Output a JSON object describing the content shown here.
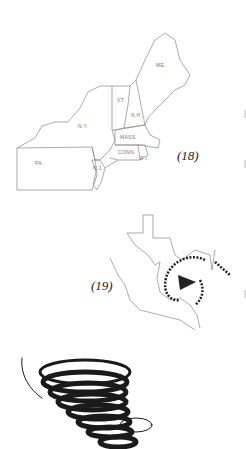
{
  "figures": [
    {
      "id": "18",
      "caption": "(18)",
      "subject": "Northeast United States map",
      "state_labels": [
        "ME.",
        "VT.",
        "N.H.",
        "N.Y.",
        "MASS.",
        "CONN.",
        "R.I.",
        "PA.",
        "N.J."
      ]
    },
    {
      "id": "19",
      "caption": "(19)",
      "subject": "Texas / Gulf of Mexico map with hurricane spiral"
    },
    {
      "id": "20",
      "subject": "Tornado funnel sketch"
    }
  ],
  "colors": {
    "line": "#888888",
    "ink": "#1a1a1a",
    "background": "#ffffff"
  }
}
